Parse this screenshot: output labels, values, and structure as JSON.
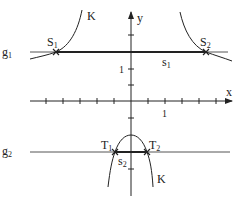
{
  "diagram": {
    "axes": {
      "x_label": "x",
      "y_label": "y",
      "x_unit_label": "1",
      "y_unit_label": "1"
    },
    "curve": {
      "name": "K",
      "label_upper": "K",
      "label_lower": "K"
    },
    "lines": [
      {
        "name": "g1",
        "label_main": "g",
        "label_sub": "1"
      },
      {
        "name": "g2",
        "label_main": "g",
        "label_sub": "2"
      }
    ],
    "points": [
      {
        "name": "S1",
        "label_main": "S",
        "label_sub": "1"
      },
      {
        "name": "S2",
        "label_main": "S",
        "label_sub": "2"
      },
      {
        "name": "T1",
        "label_main": "T",
        "label_sub": "1"
      },
      {
        "name": "T2",
        "label_main": "T",
        "label_sub": "2"
      }
    ],
    "segments": [
      {
        "name": "s1",
        "label_main": "s",
        "label_sub": "1"
      },
      {
        "name": "s2",
        "label_main": "s",
        "label_sub": "2"
      }
    ],
    "colors": {
      "stroke": "#222222",
      "line": "#555555",
      "background": "#ffffff"
    }
  }
}
